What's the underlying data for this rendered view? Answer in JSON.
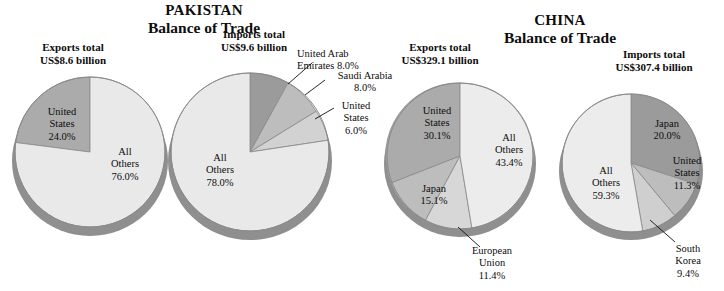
{
  "figure": {
    "kind": "pie-chart-figure",
    "panels": [
      {
        "id": "pakistan",
        "title_line1": "PAKISTAN",
        "title_line2": "Balance of Trade"
      },
      {
        "id": "china",
        "title_line1": "CHINA",
        "title_line2": "Balance of Trade"
      }
    ]
  },
  "totals": {
    "pakistan_exports_l1": "Exports total",
    "pakistan_exports_l2": "US$8.6 billion",
    "pakistan_imports_l1": "Imports total",
    "pakistan_imports_l2": "US$9.6 billion",
    "china_exports_l1": "Exports total",
    "china_exports_l2": "US$329.1 billion",
    "china_imports_l1": "Imports total",
    "china_imports_l2": "US$307.4 billion"
  },
  "labels": {
    "pk_exp_us": "United\nStates\n24.0%",
    "pk_exp_other": "All\nOthers\n76.0%",
    "pk_imp_uae": "United Arab\nEmirates 8.0%",
    "pk_imp_ksa": "Saudi Arabia\n8.0%",
    "pk_imp_us": "United\nStates\n6.0%",
    "pk_imp_other": "All\nOthers\n78.0%",
    "cn_exp_us": "United\nStates\n30.1%",
    "cn_exp_jp": "Japan\n15.1%",
    "cn_exp_eu": "European\nUnion\n11.4%",
    "cn_exp_other": "All\nOthers\n43.4%",
    "cn_imp_jp": "Japan\n20.0%",
    "cn_imp_us": "United\nStates\n11.3%",
    "cn_imp_kr": "South\nKorea\n9.4%",
    "cn_imp_other": "All\nOthers\n59.3%"
  },
  "colors": {
    "darkest": "#9b9b9b",
    "dark": "#ababab",
    "medium": "#bdbdbd",
    "light": "#d2d2d2",
    "lightest": "#e9e9e9",
    "edge": "#6f6f6f",
    "stroke": "#8a8a8a",
    "text": "#0d0d0d"
  },
  "chart_data": [
    {
      "type": "pie",
      "title": "PAKISTAN Balance of Trade",
      "subtitle": "Exports total US$8.6 billion",
      "legend": "labels-on-slices",
      "categories": [
        "United States",
        "All Others"
      ],
      "values": [
        24.0,
        76.0
      ],
      "unit": "percent",
      "colors": [
        "#ababab",
        "#e9e9e9"
      ],
      "start_angle_deg": 0,
      "direction": "counterclockwise"
    },
    {
      "type": "pie",
      "title": "PAKISTAN Balance of Trade",
      "subtitle": "Imports total US$9.6 billion",
      "legend": "labels-on-slices",
      "categories": [
        "United Arab Emirates",
        "Saudi Arabia",
        "United States",
        "All Others"
      ],
      "values": [
        8.0,
        8.0,
        6.0,
        78.0
      ],
      "unit": "percent",
      "colors": [
        "#9b9b9b",
        "#bdbdbd",
        "#d2d2d2",
        "#e9e9e9"
      ],
      "start_angle_deg": 0,
      "direction": "clockwise"
    },
    {
      "type": "pie",
      "title": "CHINA Balance of Trade",
      "subtitle": "Exports total US$329.1 billion",
      "legend": "labels-on-slices",
      "categories": [
        "United States",
        "Japan",
        "European Union",
        "All Others"
      ],
      "values": [
        30.1,
        15.1,
        11.4,
        43.4
      ],
      "unit": "percent",
      "colors": [
        "#ababab",
        "#bdbdbd",
        "#d7d7d7",
        "#ececec"
      ],
      "start_angle_deg": 0,
      "direction": "counterclockwise"
    },
    {
      "type": "pie",
      "title": "CHINA Balance of Trade",
      "subtitle": "Imports total US$307.4 billion",
      "legend": "labels-on-slices",
      "categories": [
        "Japan",
        "United States",
        "South Korea",
        "All Others"
      ],
      "values": [
        20.0,
        11.3,
        9.4,
        59.3
      ],
      "unit": "percent",
      "colors": [
        "#9b9b9b",
        "#bdbdbd",
        "#cfcfcf",
        "#ececec"
      ],
      "start_angle_deg": 0,
      "direction": "clockwise"
    }
  ]
}
